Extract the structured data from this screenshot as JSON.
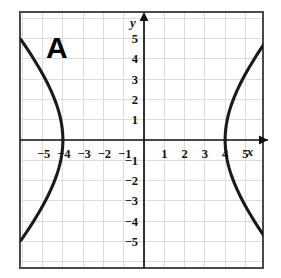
{
  "figure": {
    "label": "A",
    "type": "hyperbola-graph",
    "background_color": "#ffffff",
    "border_color": "#3a3a3a",
    "grid_color": "#dcdcdc",
    "axis_color": "#111111",
    "curve_color": "#1a1a1a"
  },
  "axes": {
    "x_axis_label": "x",
    "y_axis_label": "y",
    "x_tick_labels": [
      "−5",
      "−4",
      "−3",
      "−2",
      "−1",
      "1",
      "2",
      "3",
      "4",
      "5"
    ],
    "y_tick_labels": [
      "5",
      "4",
      "3",
      "2",
      "1",
      "−1",
      "−2",
      "−3",
      "−4",
      "−5"
    ],
    "x_tick_values": [
      -5,
      -4,
      -3,
      -2,
      -1,
      1,
      2,
      3,
      4,
      5
    ],
    "y_tick_values": [
      5,
      4,
      3,
      2,
      1,
      -1,
      -2,
      -3,
      -4,
      -5
    ],
    "x_obscured_ticks": [
      "−4",
      "4"
    ],
    "has_x_arrow": true,
    "has_y_arrow": true
  },
  "chart_data": {
    "type": "line",
    "title": "A",
    "xlabel": "x",
    "ylabel": "y",
    "xlim": [
      -6,
      6
    ],
    "ylim": [
      -6,
      6
    ],
    "grid": true,
    "legend": "none",
    "curve_kind": "hyperbola",
    "orientation": "horizontal",
    "vertices": [
      [
        -4,
        0
      ],
      [
        4,
        0
      ]
    ],
    "series": [
      {
        "name": "right-branch-upper",
        "x": [
          4.0,
          4.05,
          4.2,
          4.45,
          4.8,
          5.2,
          5.65,
          6.0
        ],
        "y": [
          0.0,
          0.9,
          1.8,
          2.6,
          3.3,
          3.95,
          4.5,
          4.85
        ]
      },
      {
        "name": "right-branch-lower",
        "x": [
          4.0,
          4.05,
          4.2,
          4.45,
          4.8,
          5.2,
          5.65,
          6.0
        ],
        "y": [
          0.0,
          -0.9,
          -1.8,
          -2.6,
          -3.3,
          -3.95,
          -4.5,
          -4.85
        ]
      },
      {
        "name": "left-branch-upper",
        "x": [
          -4.0,
          -4.05,
          -4.2,
          -4.45,
          -4.8,
          -5.2,
          -5.65,
          -6.0
        ],
        "y": [
          0.0,
          0.9,
          1.8,
          2.6,
          3.3,
          3.95,
          4.5,
          4.85
        ]
      },
      {
        "name": "left-branch-lower",
        "x": [
          -4.0,
          -4.05,
          -4.2,
          -4.45,
          -4.8,
          -5.2,
          -5.65,
          -6.0
        ],
        "y": [
          0.0,
          -0.9,
          -1.8,
          -2.6,
          -3.3,
          -3.95,
          -4.5,
          -4.85
        ]
      }
    ],
    "annotations": [
      {
        "text": "A",
        "x": -4.6,
        "y": 4.6,
        "style": "bold-large"
      }
    ]
  }
}
